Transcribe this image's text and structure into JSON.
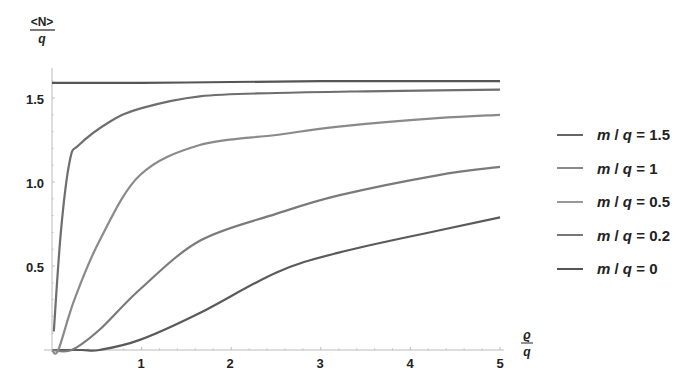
{
  "chart_data": {
    "type": "line",
    "title": "",
    "xlabel": "ϱ/q",
    "ylabel": "<N>/q",
    "xlabel_parts": {
      "num": "ϱ",
      "den": "q"
    },
    "ylabel_parts": {
      "num": "<N>",
      "den": "q"
    },
    "xlim": [
      0,
      5
    ],
    "ylim": [
      0,
      1.6
    ],
    "xticks": [
      1,
      2,
      3,
      4,
      5
    ],
    "yticks": [
      0.5,
      1.0,
      1.5
    ],
    "xtick_labels": [
      "1",
      "2",
      "3",
      "4",
      "5"
    ],
    "ytick_labels": [
      "0.5",
      "1.0",
      "1.5"
    ],
    "grid": false,
    "legend_position": "right",
    "series": [
      {
        "name": "m/q = 1.5",
        "color": "#5a5a5a",
        "x": [
          0.33,
          0.53,
          0.98,
          1.65,
          2.5,
          3.2,
          4.3,
          5.0
        ],
        "y": [
          0.0,
          0.0,
          0.06,
          0.22,
          0.46,
          0.58,
          0.71,
          0.79
        ]
      },
      {
        "name": "m/q = 1",
        "color": "#7a7a7a",
        "x": [
          0.22,
          0.53,
          0.98,
          1.65,
          2.5,
          3.2,
          4.3,
          5.0
        ],
        "y": [
          0.0,
          0.12,
          0.36,
          0.65,
          0.81,
          0.92,
          1.04,
          1.09
        ]
      },
      {
        "name": "m/q = 0.5",
        "color": "#8a8a8a",
        "x": [
          0.07,
          0.25,
          0.53,
          0.98,
          1.65,
          2.5,
          3.2,
          4.3,
          5.0
        ],
        "y": [
          0.0,
          0.3,
          0.65,
          1.04,
          1.22,
          1.28,
          1.33,
          1.38,
          1.4
        ]
      },
      {
        "name": "m/q = 0.2",
        "color": "#6e6e6e",
        "x": [
          0.02,
          0.1,
          0.2,
          0.3,
          0.65,
          1.0,
          1.65,
          2.5,
          3.5,
          4.3,
          5.0
        ],
        "y": [
          0.11,
          0.71,
          1.13,
          1.22,
          1.36,
          1.44,
          1.51,
          1.53,
          1.54,
          1.545,
          1.55
        ]
      },
      {
        "name": "m/q = 0",
        "color": "#555555",
        "x": [
          0.0,
          1.0,
          2.0,
          3.0,
          4.0,
          5.0
        ],
        "y": [
          1.59,
          1.59,
          1.595,
          1.6,
          1.6,
          1.6
        ]
      }
    ]
  },
  "legend": [
    {
      "m": "m",
      "q": "q",
      "value": "1.5"
    },
    {
      "m": "m",
      "q": "q",
      "value": "1"
    },
    {
      "m": "m",
      "q": "q",
      "value": "0.5"
    },
    {
      "m": "m",
      "q": "q",
      "value": "0.2"
    },
    {
      "m": "m",
      "q": "q",
      "value": "0"
    }
  ]
}
